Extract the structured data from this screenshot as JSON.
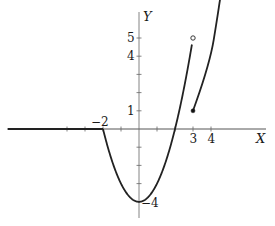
{
  "chart_data": {
    "type": "line",
    "title": "",
    "xlabel": "X",
    "ylabel": "Y",
    "xlim": [
      -7.3,
      7.0
    ],
    "ylim": [
      -5.0,
      7.2
    ],
    "grid": false,
    "legend": null,
    "x_tick_labels": [
      {
        "value": -2,
        "label": "−2"
      },
      {
        "value": 3,
        "label": "3"
      },
      {
        "value": 4,
        "label": "4"
      }
    ],
    "x_ticks": [
      -4,
      -3,
      -2,
      -1,
      1,
      2,
      3,
      4
    ],
    "y_tick_labels": [
      {
        "value": 5,
        "label": "5"
      },
      {
        "value": 4,
        "label": "4"
      },
      {
        "value": 1,
        "label": "1"
      },
      {
        "value": -4,
        "label": "−4"
      }
    ],
    "y_ticks": [
      5,
      4,
      3,
      2,
      1,
      -1,
      -2,
      -3,
      -4
    ],
    "series": [
      {
        "name": "y = 0 (x ≤ −2)",
        "x": [
          -7.3,
          -2
        ],
        "y": [
          0,
          0
        ]
      },
      {
        "name": "y = x² − 4 (−2 ≤ x < 3)",
        "x": [
          -2,
          -1.5,
          -1,
          -0.5,
          0,
          0.5,
          1,
          1.5,
          2,
          2.5,
          3
        ],
        "y": [
          0,
          -1.75,
          -3,
          -3.75,
          -4,
          -3.75,
          -3,
          -1.75,
          0,
          2.25,
          5
        ]
      },
      {
        "name": "right branch (x ≥ 3)",
        "x": [
          3,
          3.5,
          4,
          4.5
        ],
        "y": [
          1,
          2.6,
          4.5,
          7.0
        ]
      }
    ],
    "points": [
      {
        "x": 3,
        "y": 5,
        "style": "open"
      },
      {
        "x": 3,
        "y": 1,
        "style": "filled"
      }
    ]
  }
}
